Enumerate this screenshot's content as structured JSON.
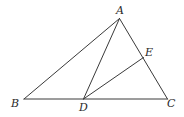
{
  "diagram": {
    "type": "geometry-triangle",
    "points": {
      "A": {
        "label": "A",
        "x": 119.5,
        "y": 18.5
      },
      "B": {
        "label": "B",
        "x": 24,
        "y": 99
      },
      "C": {
        "label": "C",
        "x": 167.5,
        "y": 99
      },
      "D": {
        "label": "D",
        "x": 83.5,
        "y": 99
      },
      "E": {
        "label": "E",
        "x": 143.5,
        "y": 57.5
      }
    },
    "segments": [
      {
        "from": "A",
        "to": "B"
      },
      {
        "from": "B",
        "to": "C"
      },
      {
        "from": "C",
        "to": "A"
      },
      {
        "from": "A",
        "to": "D"
      },
      {
        "from": "D",
        "to": "E"
      }
    ],
    "label_positions": {
      "A": {
        "x": 116,
        "y": 14
      },
      "B": {
        "x": 11,
        "y": 107
      },
      "C": {
        "x": 167,
        "y": 107
      },
      "D": {
        "x": 79,
        "y": 110
      },
      "E": {
        "x": 145,
        "y": 56
      }
    },
    "line_color": "#3a3a3a",
    "label_color": "#2a2a2a"
  }
}
